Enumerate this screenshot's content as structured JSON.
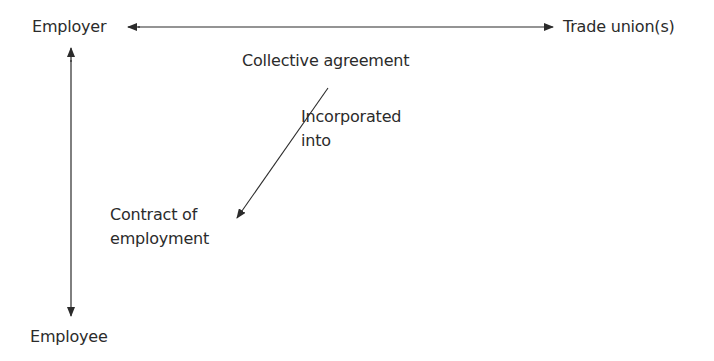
{
  "diagram": {
    "nodes": {
      "employer": "Employer",
      "trade_unions": "Trade union(s)",
      "employee": "Employee",
      "collective_agreement": "Collective agreement",
      "contract_line1": "Contract of",
      "contract_line2": "employment"
    },
    "edge_labels": {
      "incorporated_line1": "Incorporated",
      "incorporated_line2": "into"
    },
    "edges": [
      {
        "from": "Employer",
        "to": "Trade union(s)",
        "type": "bidirectional"
      },
      {
        "from": "Employer",
        "to": "Employee",
        "type": "bidirectional"
      },
      {
        "from": "Collective agreement",
        "to": "Contract of employment",
        "label": "Incorporated into",
        "type": "directed"
      }
    ],
    "colors": {
      "line": "#2b2b2b",
      "text": "#2b2b2b",
      "background": "#ffffff"
    }
  }
}
